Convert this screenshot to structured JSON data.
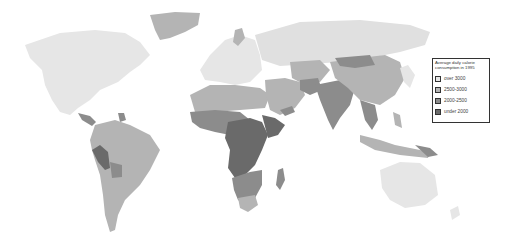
{
  "map": {
    "title": "Average daily calorie consumption in 1995",
    "colors": {
      "over_3000": "#e6e6e6",
      "2500_3000": "#b4b4b4",
      "2000_2500": "#8c8c8c",
      "under_2000": "#6a6a6a",
      "background": "#ffffff"
    }
  },
  "legend": {
    "title": "Average daily calorie consumption in 1995",
    "items": [
      {
        "label": "over 3000",
        "color": "#e6e6e6"
      },
      {
        "label": "2500-3000",
        "color": "#b4b4b4"
      },
      {
        "label": "2000-2500",
        "color": "#8c8c8c"
      },
      {
        "label": "under 2000",
        "color": "#6a6a6a"
      }
    ]
  }
}
